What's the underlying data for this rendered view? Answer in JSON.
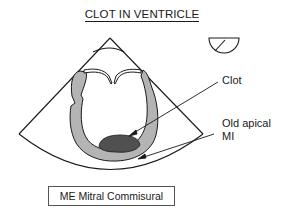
{
  "title": "CLOT IN VENTRICLE",
  "labels": {
    "clot": "Clot",
    "old_apical_mi_line1": "Old apical",
    "old_apical_mi_line2": "MI"
  },
  "view_name": "ME Mitral Commisural",
  "icons": {
    "orientation": "half-circle-with-angle-indicator"
  },
  "colors": {
    "myocardium": "#b4b4b4",
    "clot": "#505050",
    "outline": "#1a1a1a"
  }
}
